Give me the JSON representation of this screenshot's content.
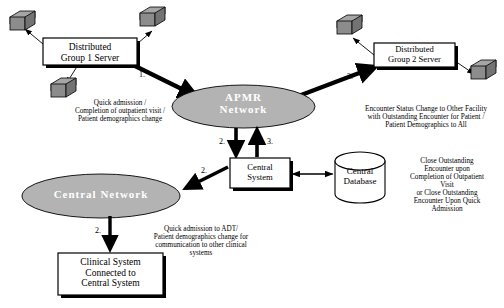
{
  "diagram": {
    "colors": {
      "ellipse_fill": "#b3b3b3",
      "ellipse_label": "#ffffff",
      "box_fill": "#ffffff",
      "stroke": "#000000",
      "icon_fill": "#8c8c8c",
      "icon_top": "#a6a6a6",
      "background": "#ffffff"
    },
    "nodes": {
      "group1_server": {
        "line1": "Distributed",
        "line2": "Group 1 Server"
      },
      "group2_server": {
        "line1": "Distributed",
        "line2": "Group 2 Server"
      },
      "apmr_network": {
        "line1": "APMR",
        "line2": "Network"
      },
      "central_network": {
        "line1": "Central Network"
      },
      "central_system": {
        "line1": "Central",
        "line2": "System"
      },
      "central_database": {
        "line1": "Central",
        "line2": "Database"
      },
      "clinical_system": {
        "line1": "Clinical System",
        "line2": "Connected to",
        "line3": "Central System"
      }
    },
    "annotations": {
      "left_flow": {
        "line1": "Quick admission /",
        "line2": "Completion of outpatient visit  /",
        "line3": "Patient demographics change"
      },
      "right_flow": {
        "line1": "Encounter Status Change to Other Facility",
        "line2": "with Outstanding Encounter  for Patient /",
        "line3": "Patient Demographics to All"
      },
      "database_flow": {
        "line1": "Close Outstanding",
        "line2": "Encounter upon",
        "line3": "Completion of Outpatient",
        "line4": "Visit",
        "line5": "or Close Outstanding",
        "line6": "Encounter Upon Quick",
        "line7": "Admission"
      },
      "clinical_flow": {
        "line1": "Quick admission to ADT/",
        "line2": "Patient demographics change for",
        "line3": "communication  to other clinical",
        "line4": "systems"
      }
    },
    "step_labels": {
      "g1_to_apmr": "1.",
      "apmr_to_g2": "3.",
      "apmr_to_central_system": "2.",
      "central_system_to_apmr": "3.",
      "central_system_to_central_network": "2.",
      "central_network_to_clinical": "2."
    }
  }
}
